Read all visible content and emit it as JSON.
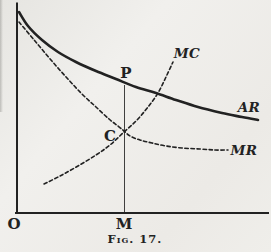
{
  "figure": {
    "caption": "Fig. 17.",
    "colors": {
      "paper": "#edece8",
      "ink": "#222222"
    },
    "axis_labels": {
      "origin": "O",
      "quantity_point": "M"
    },
    "point_labels": {
      "price_point": "P",
      "cost_point": "C"
    },
    "curves": [
      {
        "id": "ar",
        "label": "AR",
        "style": "solid",
        "points": [
          [
            19,
            12
          ],
          [
            28,
            26
          ],
          [
            42,
            40
          ],
          [
            58,
            52
          ],
          [
            76,
            62
          ],
          [
            96,
            71
          ],
          [
            116,
            79
          ],
          [
            136,
            87
          ],
          [
            156,
            93
          ],
          [
            176,
            100
          ],
          [
            198,
            107
          ],
          [
            222,
            113
          ],
          [
            242,
            117
          ],
          [
            258,
            120
          ]
        ]
      },
      {
        "id": "mr",
        "label": "MR",
        "style": "dashed",
        "points": [
          [
            19,
            22
          ],
          [
            35,
            41
          ],
          [
            51,
            60
          ],
          [
            67,
            78
          ],
          [
            82,
            94
          ],
          [
            96,
            107
          ],
          [
            109,
            119
          ],
          [
            118,
            126
          ],
          [
            124,
            131
          ],
          [
            130,
            136
          ],
          [
            140,
            140
          ],
          [
            152,
            143
          ],
          [
            166,
            146
          ],
          [
            182,
            148
          ],
          [
            200,
            149
          ],
          [
            215,
            150
          ],
          [
            228,
            150
          ]
        ]
      },
      {
        "id": "mc",
        "label": "MC",
        "style": "dashed",
        "points": [
          [
            44,
            184
          ],
          [
            60,
            176
          ],
          [
            78,
            166
          ],
          [
            96,
            155
          ],
          [
            110,
            145
          ],
          [
            124,
            132
          ],
          [
            137,
            120
          ],
          [
            148,
            107
          ],
          [
            158,
            93
          ],
          [
            166,
            77
          ],
          [
            173,
            62
          ]
        ]
      }
    ],
    "guide_line": {
      "x": 124.5,
      "top": 85,
      "bottom": 213
    }
  }
}
